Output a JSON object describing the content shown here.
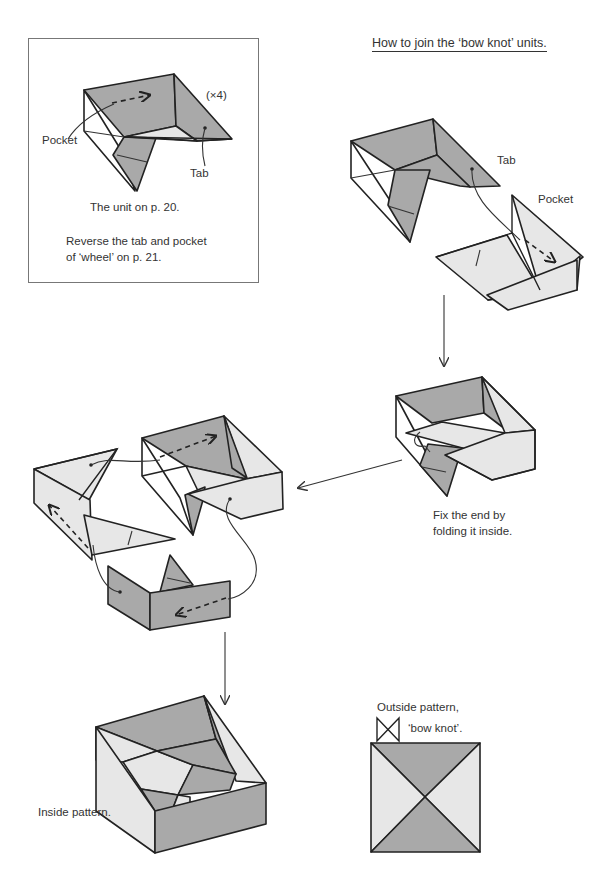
{
  "page": {
    "title": "How to join the ‘bow knot’ units."
  },
  "inset": {
    "multiplier": "(×4)",
    "pocket_label": "Pocket",
    "tab_label": "Tab",
    "caption": "The unit on p. 20.",
    "note_line1": "Reverse the tab and pocket",
    "note_line2": "of ‘wheel’ on p. 21."
  },
  "step1": {
    "tab_label": "Tab",
    "pocket_label": "Pocket"
  },
  "step2": {
    "caption_line1": "Fix the end by",
    "caption_line2": "folding it inside."
  },
  "result": {
    "inside_label": "Inside pattern.",
    "outside_label_line1": "Outside pattern,",
    "outside_label_line2": "‘bow knot’.",
    "bow_icon": "bow-knot-icon"
  },
  "colors": {
    "dark_face": "#a9a9a9",
    "light_face": "#e7e7e7",
    "line": "#222222",
    "frame": "#777777"
  }
}
